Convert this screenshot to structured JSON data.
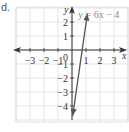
{
  "problem_label": "d.",
  "chart_data": {
    "type": "line",
    "title": "",
    "equation": "y = 6x − 4",
    "xlabel": "x",
    "ylabel": "y",
    "xlim": [
      -3.5,
      3.5
    ],
    "ylim": [
      -4.5,
      2.5
    ],
    "x_ticks": [
      -3,
      -2,
      -1,
      1,
      2,
      3
    ],
    "x_tick_labels": [
      "−3",
      "−2",
      "−1",
      "1",
      "2",
      "3"
    ],
    "y_ticks": [
      2,
      1,
      -1,
      -2,
      -3,
      -4
    ],
    "y_tick_labels": [
      "2",
      "1",
      "−1",
      "−2",
      "−3",
      "−4"
    ],
    "origin_label": "0",
    "grid": true,
    "series": [
      {
        "name": "y = 6x − 4",
        "slope": 6,
        "intercept": -4,
        "x": [
          0.05,
          1.1
        ],
        "y": [
          -4.7,
          2.6
        ],
        "arrows": "both"
      }
    ],
    "colors": {
      "grid": "#d8d8d8",
      "axis": "#333333",
      "line": "#555555",
      "equation": "#888888"
    }
  }
}
